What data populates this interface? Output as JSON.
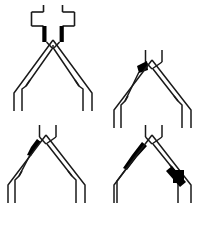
{
  "figure": {
    "title": "Coronary bifurcation lesion classification diagrams",
    "background_color": "#ffffff",
    "line_color": "#1a1a1a",
    "plaque_color": "#000000",
    "panel_count": 4,
    "layout": "2x2 grid"
  },
  "panels": [
    {
      "id": "panel-top-left",
      "name": "bifurcation-diagram-a",
      "label": "A",
      "position": "top-left",
      "has_crossing_branch": true,
      "crossing_branch_name": "side-branch-horizontal",
      "plaques": [
        {
          "name": "proximal-main-vessel-plaque-left",
          "location": "proximal main vessel, left wall",
          "shape": "bar",
          "color": "#000000"
        },
        {
          "name": "proximal-main-vessel-plaque-right",
          "location": "proximal main vessel, right wall",
          "shape": "bar",
          "color": "#000000"
        }
      ]
    },
    {
      "id": "panel-top-right",
      "name": "bifurcation-diagram-b",
      "label": "B",
      "position": "top-right",
      "has_crossing_branch": false,
      "plaques": [
        {
          "name": "apex-plaque-left-branch",
          "location": "carina, left distal branch ostium",
          "shape": "wedge",
          "color": "#000000"
        }
      ]
    },
    {
      "id": "panel-bottom-left",
      "name": "bifurcation-diagram-c",
      "label": "C",
      "position": "bottom-left",
      "has_crossing_branch": false,
      "plaques": [
        {
          "name": "left-branch-proximal-plaque",
          "location": "left distal branch, proximal segment",
          "shape": "tapered-band",
          "color": "#000000"
        }
      ]
    },
    {
      "id": "panel-bottom-right",
      "name": "bifurcation-diagram-d",
      "label": "D",
      "position": "bottom-right",
      "has_crossing_branch": false,
      "plaques": [
        {
          "name": "left-branch-long-plaque",
          "location": "left distal branch, long lesion",
          "shape": "tapered-band",
          "color": "#000000"
        },
        {
          "name": "right-branch-block-plaque",
          "location": "right distal branch, mid segment",
          "shape": "block",
          "color": "#000000"
        }
      ]
    }
  ]
}
